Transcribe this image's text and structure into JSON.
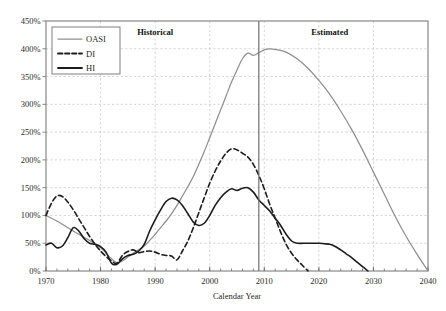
{
  "chart_data": {
    "type": "line",
    "title": "",
    "xlabel": "Calendar Year",
    "ylabel": "",
    "xlim": [
      1970,
      2040
    ],
    "ylim": [
      0,
      450
    ],
    "grid": true,
    "x_ticks": [
      1970,
      1980,
      1990,
      2000,
      2010,
      2020,
      2030,
      2040
    ],
    "x_tick_labels": [
      "1970",
      "1980",
      "1990",
      "2000",
      "2010",
      "2020",
      "2030",
      "2040"
    ],
    "x_minor_step": 2,
    "y_ticks": [
      0,
      50,
      100,
      150,
      200,
      250,
      300,
      350,
      400,
      450
    ],
    "y_tick_labels": [
      "0%",
      "50%",
      "100%",
      "150%",
      "200%",
      "250%",
      "300%",
      "350%",
      "400%",
      "450%"
    ],
    "legend_position": "top-left",
    "legend_entries": [
      {
        "name": "OASI",
        "style": "solid",
        "color": "#8f8f8f"
      },
      {
        "name": "DI",
        "style": "dashed",
        "color": "#1c1c1c"
      },
      {
        "name": "HI",
        "style": "solid",
        "color": "#1c1c1c"
      }
    ],
    "annotations": [
      {
        "text": "Historical",
        "x": 1990,
        "y": 425,
        "bold": true
      },
      {
        "text": "Estimated",
        "x": 2022,
        "y": 425,
        "bold": true
      },
      {
        "text": "divider",
        "x": 2009,
        "type": "vline"
      }
    ],
    "series": [
      {
        "name": "OASI",
        "style": "solid",
        "color": "#8f8f8f",
        "x": [
          1970,
          1972,
          1974,
          1976,
          1978,
          1980,
          1981,
          1982,
          1983,
          1984,
          1985,
          1986,
          1987,
          1988,
          1989,
          1990,
          1991,
          1992,
          1993,
          1994,
          1995,
          1996,
          1997,
          1998,
          1999,
          2000,
          2001,
          2002,
          2003,
          2004,
          2005,
          2006,
          2007,
          2008,
          2009,
          2010,
          2011,
          2012,
          2014,
          2016,
          2018,
          2020,
          2022,
          2024,
          2026,
          2028,
          2030,
          2032,
          2034,
          2036,
          2038,
          2040
        ],
        "y": [
          100,
          90,
          78,
          66,
          55,
          42,
          32,
          22,
          15,
          18,
          25,
          32,
          38,
          45,
          55,
          66,
          78,
          90,
          103,
          118,
          135,
          152,
          170,
          192,
          215,
          240,
          265,
          290,
          315,
          340,
          362,
          382,
          392,
          388,
          393,
          398,
          400,
          399,
          394,
          382,
          365,
          343,
          318,
          288,
          255,
          218,
          178,
          138,
          98,
          62,
          30,
          0
        ]
      },
      {
        "name": "DI",
        "style": "dashed",
        "color": "#1c1c1c",
        "x": [
          1970,
          1971,
          1972,
          1973,
          1974,
          1975,
          1976,
          1977,
          1978,
          1979,
          1980,
          1981,
          1982,
          1983,
          1984,
          1985,
          1986,
          1987,
          1988,
          1989,
          1990,
          1991,
          1992,
          1993,
          1994,
          1995,
          1996,
          1997,
          1998,
          1999,
          2000,
          2001,
          2002,
          2003,
          2004,
          2005,
          2006,
          2007,
          2008,
          2009,
          2010,
          2011,
          2012,
          2013,
          2014,
          2015,
          2016,
          2017,
          2018
        ],
        "y": [
          100,
          122,
          135,
          134,
          124,
          110,
          94,
          78,
          62,
          48,
          36,
          26,
          18,
          14,
          28,
          35,
          38,
          33,
          35,
          36,
          34,
          30,
          28,
          27,
          20,
          36,
          54,
          78,
          105,
          132,
          158,
          180,
          198,
          212,
          220,
          218,
          212,
          205,
          192,
          172,
          148,
          120,
          95,
          70,
          48,
          32,
          20,
          10,
          0
        ]
      },
      {
        "name": "HI",
        "style": "solid",
        "color": "#1c1c1c",
        "x": [
          1970,
          1971,
          1972,
          1973,
          1974,
          1975,
          1976,
          1977,
          1978,
          1979,
          1980,
          1981,
          1982,
          1983,
          1984,
          1985,
          1986,
          1987,
          1988,
          1989,
          1990,
          1991,
          1992,
          1993,
          1994,
          1995,
          1996,
          1997,
          1998,
          1999,
          2000,
          2001,
          2002,
          2003,
          2004,
          2005,
          2006,
          2007,
          2008,
          2009,
          2010,
          2011,
          2012,
          2013,
          2014,
          2015,
          2016,
          2018,
          2020,
          2021,
          2022,
          2023,
          2024,
          2025,
          2026,
          2027,
          2028,
          2029
        ],
        "y": [
          47,
          50,
          42,
          45,
          60,
          78,
          72,
          58,
          50,
          48,
          44,
          34,
          14,
          12,
          22,
          28,
          30,
          36,
          48,
          72,
          92,
          110,
          125,
          131,
          128,
          118,
          103,
          88,
          82,
          86,
          100,
          118,
          132,
          142,
          148,
          145,
          149,
          150,
          142,
          128,
          118,
          108,
          95,
          82,
          66,
          54,
          50,
          50,
          50,
          49,
          48,
          44,
          38,
          31,
          24,
          16,
          8,
          0
        ]
      }
    ]
  }
}
